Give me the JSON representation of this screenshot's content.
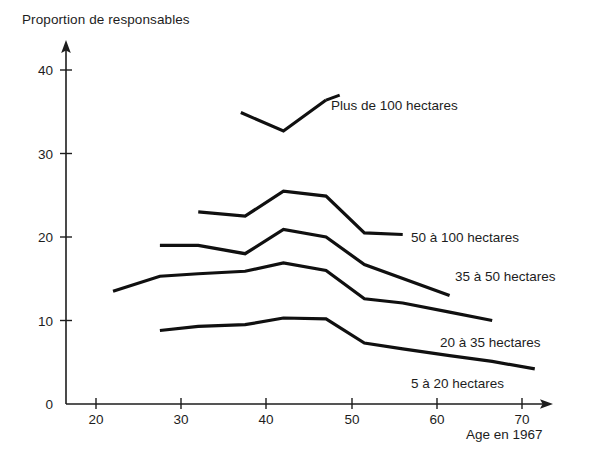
{
  "chart_data": {
    "type": "line",
    "title": "Proportion de responsables",
    "xlabel": "Age en 1967",
    "ylabel": "Proportion de responsables",
    "xlim": [
      15,
      74
    ],
    "ylim": [
      0,
      42
    ],
    "xticks": [
      20,
      30,
      40,
      50,
      60,
      70
    ],
    "yticks": [
      0,
      10,
      20,
      30,
      40
    ],
    "xtick_labels": [
      "20",
      "30",
      "40",
      "50",
      "60",
      "70"
    ],
    "ytick_labels": [
      "0",
      "10",
      "20",
      "30",
      "40"
    ],
    "grid": false,
    "legend_position": "inline-right-of-curve-ends",
    "series": [
      {
        "name": "Plus de 100 hectares",
        "label": "Plus de 100 hectares",
        "label_x": 37,
        "label_y": 36.2,
        "x": [
          37,
          42,
          47
        ],
        "y": [
          34.9,
          32.7,
          36.4
        ]
      },
      {
        "name": "50 à 100 hectares",
        "label": "50 à 100 hectares",
        "label_x": 57,
        "label_y": 20.0,
        "x": [
          32,
          37.5,
          42,
          47,
          51.5,
          56
        ],
        "y": [
          23.0,
          22.5,
          25.5,
          24.9,
          20.5,
          20.3
        ]
      },
      {
        "name": "35 à 50 hectares",
        "label": "35 à 50 hectares",
        "label_x": 58,
        "label_y": 16.6,
        "x": [
          27.5,
          32,
          37.5,
          42,
          47,
          51.5,
          61.5
        ],
        "y": [
          19.0,
          19.0,
          18.0,
          20.9,
          20.0,
          16.7,
          13.0
        ]
      },
      {
        "name": "20 à 35 hectares",
        "label": "20 à 35 hectares",
        "label_x": 58,
        "label_y": 11.5,
        "x": [
          22,
          27.5,
          32,
          37.5,
          42,
          47,
          51.5,
          56,
          61.5,
          66.5
        ],
        "y": [
          13.5,
          15.3,
          15.6,
          15.9,
          16.9,
          16.0,
          12.6,
          12.1,
          11.0,
          10.0
        ]
      },
      {
        "name": "5 à 20 hectares",
        "label": "5 à 20 hectares",
        "label_x": 53,
        "label_y": 5.0,
        "x": [
          27.5,
          32,
          37.5,
          42,
          47,
          51.5,
          56,
          61.5,
          66.5,
          71.5
        ],
        "y": [
          8.8,
          9.3,
          9.5,
          10.3,
          10.2,
          7.3,
          6.6,
          5.8,
          5.1,
          4.2
        ]
      }
    ]
  },
  "labels": {
    "title": "Proportion de responsables",
    "xaxis_title": "Age en 1967",
    "series_0": "Plus de 100 hectares",
    "series_1": "50 à 100 hectares",
    "series_2": "35 à 50 hectares",
    "series_3": "20 à 35 hectares",
    "series_4": "5 à 20 hectares",
    "y_0": "0",
    "y_10": "10",
    "y_20": "20",
    "y_30": "30",
    "y_40": "40",
    "x_20": "20",
    "x_30": "30",
    "x_40": "40",
    "x_50": "50",
    "x_60": "60",
    "x_70": "70"
  },
  "colors": {
    "line": "#101010",
    "axis": "#1d1d1d",
    "text": "#1d1d1d",
    "background": "#ffffff"
  }
}
